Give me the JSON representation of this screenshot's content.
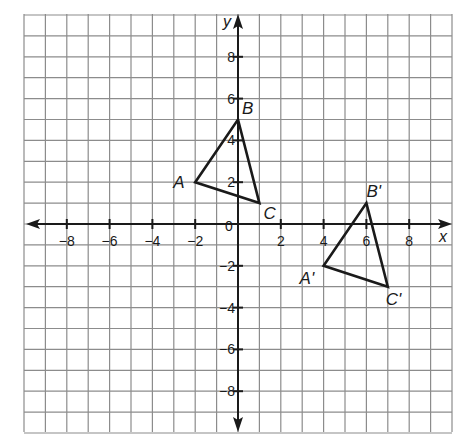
{
  "chart_data": {
    "type": "coordinate-grid",
    "title": "",
    "xlabel": "x",
    "ylabel": "y",
    "xlim": [
      -10,
      10
    ],
    "ylim": [
      -10,
      10
    ],
    "grid": true,
    "origin_label": "0",
    "x_tick_labels": [
      "-8",
      "-6",
      "-4",
      "-2",
      "2",
      "4",
      "6",
      "8"
    ],
    "y_tick_labels": [
      "8",
      "6",
      "4",
      "2",
      "-2",
      "-4",
      "-6",
      "-8"
    ],
    "x_ticks": [
      -8,
      -6,
      -4,
      -2,
      2,
      4,
      6,
      8
    ],
    "y_ticks": [
      8,
      6,
      4,
      2,
      -2,
      -4,
      -6,
      -8
    ],
    "shapes": [
      {
        "name": "Triangle ABC",
        "vertices": [
          {
            "label": "A",
            "x": -2,
            "y": 2
          },
          {
            "label": "B",
            "x": 0,
            "y": 5
          },
          {
            "label": "C",
            "x": 1,
            "y": 1
          }
        ]
      },
      {
        "name": "Triangle A'B'C'",
        "vertices": [
          {
            "label": "A'",
            "x": 4,
            "y": -2
          },
          {
            "label": "B'",
            "x": 6,
            "y": 1
          },
          {
            "label": "C'",
            "x": 7,
            "y": -3
          }
        ]
      }
    ]
  },
  "colors": {
    "grid": "#8c8c8c",
    "axis": "#1a1a1a",
    "shape": "#1a1a1a",
    "background": "#ffffff"
  }
}
